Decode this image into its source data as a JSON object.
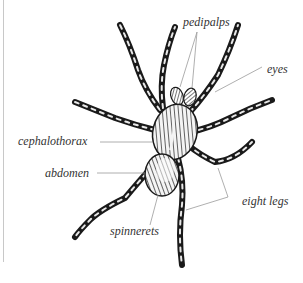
{
  "diagram": {
    "labels": {
      "pedipalps": "pedipalps",
      "eyes": "eyes",
      "cephalothorax": "cephalothorax",
      "abdomen": "abdomen",
      "eight_legs": "eight legs",
      "spinnerets": "spinnerets"
    },
    "colors": {
      "ink": "#1a1a1a",
      "leader_line": "#9a9a9a",
      "label_text": "#333333",
      "background": "#ffffff"
    }
  }
}
